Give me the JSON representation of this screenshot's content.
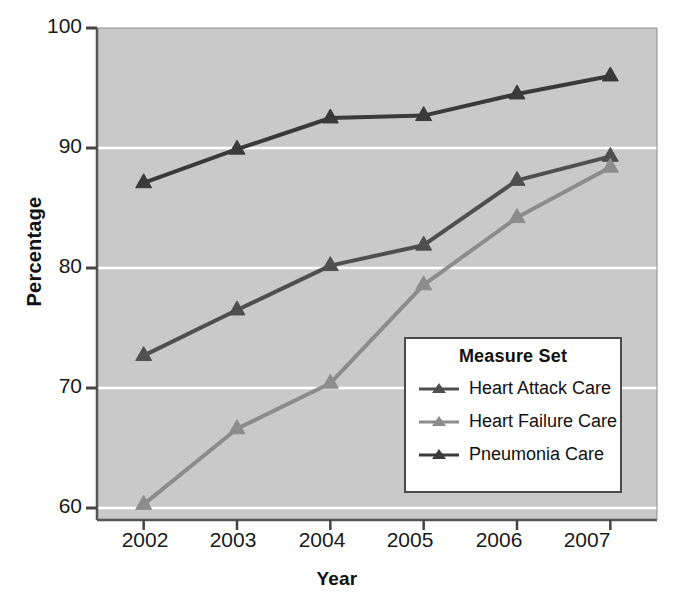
{
  "chart_data": {
    "type": "line",
    "title": "",
    "xlabel": "Year",
    "ylabel": "Percentage",
    "categories": [
      "2002",
      "2003",
      "2004",
      "2005",
      "2006",
      "2007"
    ],
    "x": [
      2002,
      2003,
      2004,
      2005,
      2006,
      2007
    ],
    "ylim": [
      60,
      100
    ],
    "yticks": [
      60,
      70,
      80,
      90,
      100
    ],
    "grid": "horizontal",
    "legend_position": "inside-lower-right",
    "legend_title": "Measure Set",
    "plot_background": "#c9c9c9",
    "gridline_color": "#ffffff",
    "series": [
      {
        "name": "Heart Attack Care",
        "color": "#4f4f4f",
        "marker": "triangle",
        "values": [
          72.7,
          76.5,
          80.2,
          81.9,
          87.3,
          89.3
        ]
      },
      {
        "name": "Heart Failure Care",
        "color": "#8c8c8c",
        "marker": "triangle",
        "values": [
          60.3,
          66.6,
          70.4,
          78.6,
          84.2,
          88.4
        ]
      },
      {
        "name": "Pneumonia Care",
        "color": "#3a3a3a",
        "marker": "triangle",
        "values": [
          87.1,
          89.9,
          92.5,
          92.7,
          94.5,
          96.0
        ]
      }
    ]
  },
  "axes": {
    "y_tick_labels": [
      "100",
      "90",
      "80",
      "70",
      "60"
    ],
    "x_tick_labels": [
      "2002",
      "2003",
      "2004",
      "2005",
      "2006",
      "2007"
    ],
    "y_axis_title": "Percentage",
    "x_axis_title": "Year"
  },
  "legend": {
    "title": "Measure Set",
    "items": [
      {
        "label": "Heart Attack Care",
        "color": "#4f4f4f"
      },
      {
        "label": "Heart Failure Care",
        "color": "#8c8c8c"
      },
      {
        "label": "Pneumonia Care",
        "color": "#3a3a3a"
      }
    ]
  }
}
